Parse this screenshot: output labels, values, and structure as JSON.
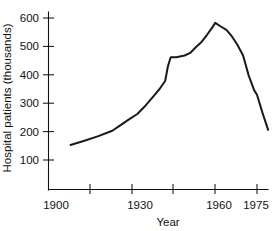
{
  "chart_data": {
    "type": "line",
    "title": "",
    "xlabel": "Year",
    "ylabel": "Hospital patients (thousands)",
    "xlim": [
      1900,
      1978
    ],
    "ylim": [
      0,
      640
    ],
    "grid": false,
    "legend": "none",
    "line_color": "#1a1a1a",
    "xticks": [
      1910,
      1920,
      1930,
      1940,
      1950,
      1960,
      1970
    ],
    "xtick_labels": [
      "1900",
      "1930",
      "1960",
      "1975"
    ],
    "xtick_label_values": [
      1903,
      1932,
      1959,
      1972
    ],
    "yticks": [
      100,
      200,
      300,
      400,
      500,
      600
    ],
    "ytick_labels": [
      "100",
      "200",
      "300",
      "400",
      "500",
      "600"
    ],
    "x": [
      1903,
      1908,
      1913,
      1918,
      1921,
      1924,
      1927,
      1930,
      1933,
      1935,
      1937,
      1938,
      1939,
      1941,
      1944,
      1946,
      1948,
      1950,
      1952,
      1954,
      1955,
      1957,
      1959,
      1961,
      1963,
      1965,
      1967,
      1969,
      1970,
      1972,
      1974
    ],
    "y": [
      153,
      168,
      184,
      203,
      223,
      243,
      262,
      292,
      327,
      350,
      378,
      430,
      462,
      462,
      468,
      477,
      497,
      515,
      540,
      568,
      583,
      570,
      558,
      535,
      505,
      468,
      398,
      345,
      330,
      265,
      206
    ],
    "series": [
      {
        "name": "Hospital patients",
        "values": [
          153,
          168,
          184,
          203,
          223,
          243,
          262,
          292,
          327,
          350,
          378,
          430,
          462,
          462,
          468,
          477,
          497,
          515,
          540,
          568,
          583,
          570,
          558,
          535,
          505,
          468,
          398,
          345,
          330,
          265,
          206
        ]
      }
    ],
    "annotations": []
  }
}
